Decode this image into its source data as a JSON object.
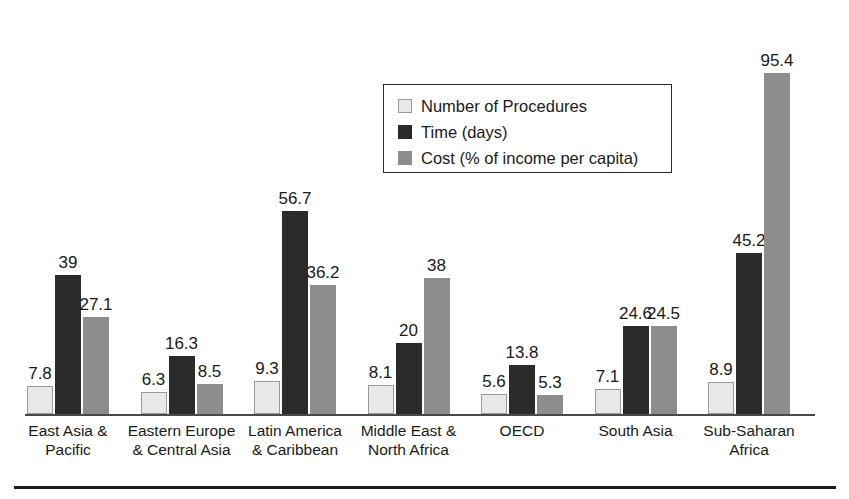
{
  "chart_data": {
    "type": "bar",
    "title": "",
    "xlabel": "",
    "ylabel": "",
    "ylim": [
      0,
      103
    ],
    "grid": false,
    "legend_position": "top-center",
    "categories": [
      "East Asia &\nPacific",
      "Eastern Europe\n& Central Asia",
      "Latin America\n& Caribbean",
      "Middle East &\nNorth Africa",
      "OECD",
      "South Asia",
      "Sub-Saharan\nAfrica"
    ],
    "series": [
      {
        "name": "Number of Procedures",
        "color": "#e9e9e9",
        "values": [
          7.8,
          6.3,
          9.3,
          8.1,
          5.6,
          7.1,
          8.9
        ],
        "labels": [
          "7.8",
          "6.3",
          "9.3",
          "8.1",
          "5.6",
          "7.1",
          "8.9"
        ]
      },
      {
        "name": "Time (days)",
        "color": "#2b2b2b",
        "values": [
          39,
          16.3,
          56.7,
          20,
          13.8,
          24.6,
          45.2
        ],
        "labels": [
          "39",
          "16.3",
          "56.7",
          "20",
          "13.8",
          "24.6",
          "45.2"
        ]
      },
      {
        "name": "Cost (% of income per capita)",
        "color": "#8d8d8d",
        "values": [
          27.1,
          8.5,
          36.2,
          38,
          5.3,
          24.5,
          95.4
        ],
        "labels": [
          "27.1",
          "8.5",
          "36.2",
          "38",
          "5.3",
          "24.5",
          "95.4"
        ]
      }
    ]
  },
  "legend": {
    "items": [
      {
        "label": "Number of Procedures"
      },
      {
        "label": "Time (days)"
      },
      {
        "label": "Cost (% of income per capita)"
      }
    ]
  }
}
